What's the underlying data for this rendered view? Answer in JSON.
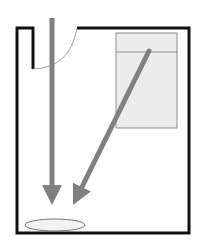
{
  "diagram": {
    "type": "floor-plan",
    "colors": {
      "wall": "#111111",
      "arrow": "#808080",
      "bed_fill": "#ececec",
      "bed_stroke": "#777777",
      "door_arc": "#888888",
      "spot_fill": "#f2f2f2",
      "spot_stroke": "#666666"
    },
    "elements": [
      {
        "name": "room-walls",
        "kind": "wall-outline"
      },
      {
        "name": "door-swing",
        "kind": "door-arc"
      },
      {
        "name": "bed",
        "kind": "rectangle",
        "has_headboard_line": true
      },
      {
        "name": "straight-arrow",
        "kind": "arrow",
        "direction": "down"
      },
      {
        "name": "diagonal-arrow",
        "kind": "arrow",
        "direction": "down-left",
        "origin": "bed"
      },
      {
        "name": "floor-spot",
        "kind": "ellipse"
      }
    ]
  }
}
